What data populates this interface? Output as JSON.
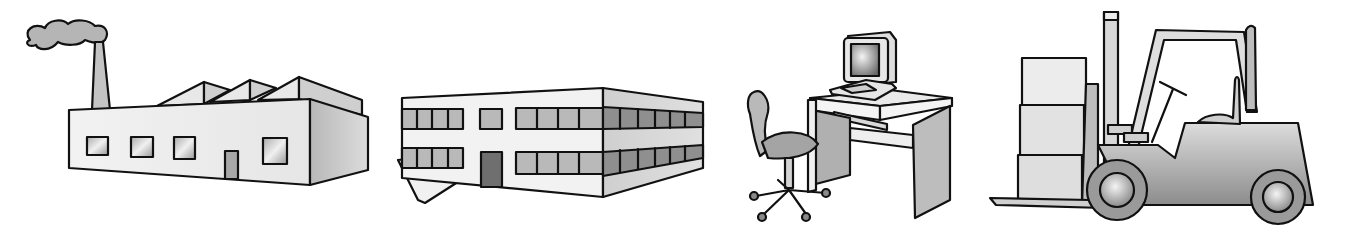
{
  "illustrations": [
    {
      "id": "factory",
      "label": "Factory with smokestack"
    },
    {
      "id": "office-building",
      "label": "Two-story office building"
    },
    {
      "id": "computer-desk",
      "label": "Computer workstation desk with office chair"
    },
    {
      "id": "forklift",
      "label": "Forklift carrying stacked boxes"
    }
  ],
  "colors": {
    "background": "#ffffff",
    "outline": "#111111",
    "light_fill": "#eeeeee",
    "mid_fill": "#c8c8c8",
    "dark_fill": "#8a8a8a"
  }
}
